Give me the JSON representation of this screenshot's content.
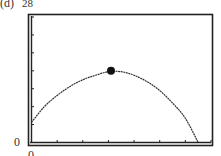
{
  "panel_label": "(d)",
  "y_max_label": "28",
  "y_min_label": "0",
  "x_min_label": "0",
  "chart_data": {
    "type": "line",
    "title": "",
    "xlabel": "",
    "ylabel": "",
    "xlim": [
      0,
      7
    ],
    "ylim": [
      0,
      28
    ],
    "grid": false,
    "x_ticks": 7,
    "y_ticks": 7,
    "series": [
      {
        "name": "parabola",
        "x": [
          0,
          0.5,
          1,
          1.5,
          2,
          2.5,
          3,
          3.5,
          4,
          4.5,
          5,
          5.5,
          6,
          6.5
        ],
        "values": [
          4.5,
          8,
          10.5,
          12.5,
          14,
          15,
          15.8,
          15.8,
          15,
          13.6,
          11.6,
          8.8,
          5.4,
          0
        ]
      }
    ],
    "highlighted_point": {
      "x": 3.1,
      "y": 16
    }
  }
}
